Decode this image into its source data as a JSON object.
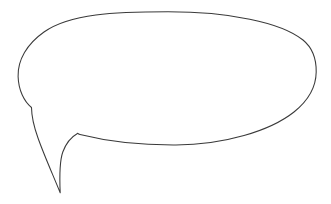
{
  "canvas": {
    "width": 331,
    "height": 204,
    "background_color": "#ffffff",
    "title": "Speech balloon outline"
  },
  "drawing": {
    "name": "speech-balloon",
    "style": "hand-drawn line art",
    "fill_color": "#ffffff",
    "stroke_color": "#3a3a3a",
    "stroke_width": 1.05,
    "has_text_content": false,
    "shape_summary": "An empty oval speech balloon with a long tapering tail pointing down and to the left",
    "ellipse_body": {
      "center_x": 167,
      "center_y": 78,
      "radius_x": 149,
      "radius_y": 67,
      "leftmost_point": [
        18,
        75
      ],
      "rightmost_point": [
        316,
        72
      ],
      "topmost_point": [
        170,
        12
      ],
      "bottommost_point": [
        175,
        145
      ]
    },
    "tail": {
      "upper_join_point": [
        31,
        108
      ],
      "tip_point": [
        60,
        193
      ],
      "lower_join_point": [
        78,
        133
      ],
      "direction": "down-left"
    },
    "outline_path": "M 31.5 107.5 C 24.0 101.5 18.5 90.0 18.1 76.5 C 17.6 60.0 27.0 44.0 44.0 32.0 C 70.0 13.5 115.0 11.8 168.0 11.8 C 228.0 11.8 281.0 22.0 303.0 40.0 C 313.5 48.6 316.4 60.0 316.2 72.0 C 316.0 86.0 309.0 100.0 294.0 112.0 C 270.0 131.0 224.0 144.8 176.0 145.0 C 140.0 145.2 104.0 140.5 80.0 134.5 C 78.9 134.2 78.2 133.8 77.8 133.2 C 72.0 136.5 66.0 143.0 62.8 152.0 C 59.6 161.0 59.4 175.0 60.2 192.8 C 53.0 175.0 44.0 155.0 38.0 138.0 C 33.5 125.5 31.6 116.0 31.5 107.5 Z"
  }
}
